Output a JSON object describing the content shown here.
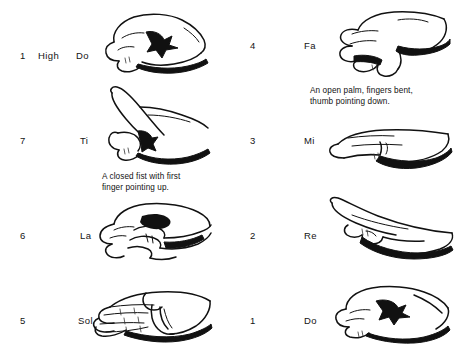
{
  "page": {
    "background_color": "#ffffff",
    "ink_color": "#111111"
  },
  "left_column": {
    "rows": [
      {
        "number": "1",
        "octave": "High",
        "syllable": "Do",
        "icon": "hand-sign-high-do",
        "description": "closed fist, knuckles forward"
      },
      {
        "number": "7",
        "octave": "",
        "syllable": "Ti",
        "icon": "hand-sign-ti",
        "description": "closed fist with first finger pointing up"
      },
      {
        "number": "6",
        "octave": "",
        "syllable": "La",
        "icon": "hand-sign-la",
        "description": "relaxed hand drooping down"
      },
      {
        "number": "5",
        "octave": "",
        "syllable": "Sol",
        "icon": "hand-sign-sol",
        "description": "open palm facing sideways"
      }
    ],
    "caption": "A closed fist with first\nfinger pointing up."
  },
  "right_column": {
    "rows": [
      {
        "number": "4",
        "octave": "",
        "syllable": "Fa",
        "icon": "hand-sign-fa",
        "description": "open palm, fingers bent, thumb pointing down"
      },
      {
        "number": "3",
        "octave": "",
        "syllable": "Mi",
        "icon": "hand-sign-mi",
        "description": "flat hand, palm down"
      },
      {
        "number": "2",
        "octave": "",
        "syllable": "Re",
        "icon": "hand-sign-re",
        "description": "flat hand angled upward"
      },
      {
        "number": "1",
        "octave": "",
        "syllable": "Do",
        "icon": "hand-sign-do",
        "description": "closed fist, knuckles forward"
      }
    ],
    "caption": "An open palm, fingers bent,\nthumb pointing down."
  }
}
